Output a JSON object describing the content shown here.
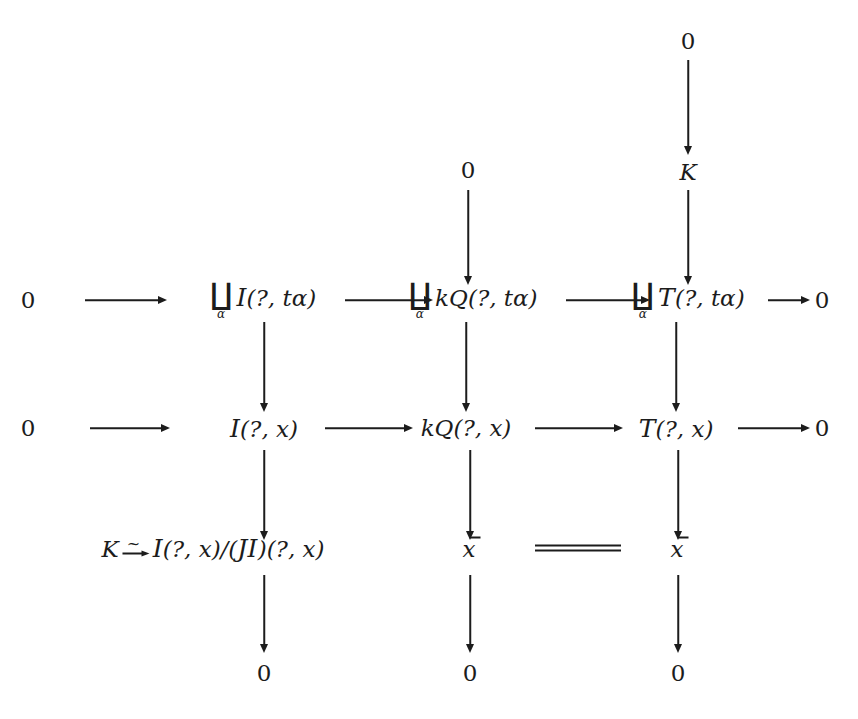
{
  "diagram": {
    "type": "commutative-diagram",
    "width": 858,
    "height": 719,
    "ink_color": "#1c1c1c",
    "background_color": "#ffffff"
  },
  "symbols": {
    "zero": "0",
    "K": "K",
    "alpha": "α",
    "coproduct": "∐",
    "tilde": "~",
    "question": "?",
    "comma": ", ",
    "t_alpha": "tα",
    "x": "x",
    "script_I": "I",
    "script_J": "J",
    "script_T": "T",
    "kQ": "kQ"
  },
  "nodes": {
    "top_mid_zero": "0",
    "top_right_zero": "0",
    "top_right_K": "K",
    "row1_left_zero": "0",
    "row1_c1_prefix": "(?, tα)",
    "row1_c2_prefix": "kQ",
    "row1_c2_args": "(?, tα)",
    "row1_c3_args": "(?, tα)",
    "row1_right_zero": "0",
    "row2_left_zero": "0",
    "row2_c1_args": "(?, x)",
    "row2_c2_label": "kQ",
    "row2_c2_args": "(?, x)",
    "row2_c3_args": "(?, x)",
    "row2_right_zero": "0",
    "row3_c1_K": "K",
    "row3_c1_tail_a": "(?, x)/(",
    "row3_c1_tail_b": ")",
    "row3_c1_tail_c": "(?, x)",
    "row3_c2_xbar": "x",
    "row3_c3_xbar": "x",
    "row4_c1_zero": "0",
    "row4_c2_zero": "0",
    "row4_c3_zero": "0"
  },
  "arrows": {
    "h_row1_a": "0 → ∐α I(?, tα)",
    "h_row1_b": "∐α I(?, tα) → ∐α kQ(?, tα)",
    "h_row1_c": "∐α kQ(?, tα) → ∐α T(?, tα)",
    "h_row1_d": "∐α T(?, tα) → 0",
    "h_row2_a": "0 → I(?, x)",
    "h_row2_b": "I(?, x) → kQ(?, x)",
    "h_row2_c": "kQ(?, x) → T(?, x)",
    "h_row2_d": "T(?, x) → 0",
    "v_top_mid": "0 → ∐α kQ(?, tα)",
    "v_top_right_0K": "0 → K",
    "v_top_right_K": "K → ∐α T(?, tα)",
    "v_c1_r1r2": "∐α I(?, tα) → I(?, x)",
    "v_c2_r1r2": "∐α kQ(?, tα) → kQ(?, x)",
    "v_c3_r1r2": "∐α T(?, tα) → T(?, x)",
    "v_c1_r2r3": "I(?, x) → I(?, x)/(JI)(?, x)",
    "v_c2_r2r3": "kQ(?, x) → x̄",
    "v_c3_r2r3": "T(?, x) → x̄",
    "v_c1_r3r4": "I(?, x)/(JI)(?, x) → 0",
    "v_c2_r3r4": "x̄ → 0",
    "v_c3_r3r4": "x̄ → 0",
    "eq_row3": "x̄ = x̄"
  }
}
